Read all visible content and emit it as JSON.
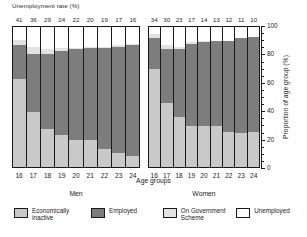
{
  "top_title": "Unemployment rate (%)",
  "axis": {
    "x_title": "Age groups",
    "y_title": "Proportion of age group (%)",
    "y_ticks": [
      "0",
      "20",
      "40",
      "60",
      "80",
      "100"
    ]
  },
  "panels": [
    {
      "name": "Men",
      "key": "men"
    },
    {
      "name": "Women",
      "key": "women"
    }
  ],
  "legend": [
    {
      "label": "Economically inactive",
      "color": "#c9c9c9",
      "key": "inactive"
    },
    {
      "label": "Employed",
      "color": "#7d7d7d",
      "key": "employed"
    },
    {
      "label": "On Government Scheme",
      "color": "#e2e2e2",
      "key": "scheme"
    },
    {
      "label": "Unemployed",
      "color": "#ffffff",
      "key": "unemployed"
    }
  ],
  "chart_data": {
    "type": "bar",
    "title": "Unemployment rate (%)",
    "xlabel": "Age groups",
    "ylabel": "Proportion of age group (%)",
    "ylim": [
      0,
      100
    ],
    "stacked": true,
    "grid": false,
    "legend_position": "bottom",
    "categories": [
      "16",
      "17",
      "18",
      "19",
      "20",
      "21",
      "22",
      "23",
      "24"
    ],
    "panels": [
      {
        "name": "Men",
        "unemployment_rate": [
          41,
          36,
          29,
          24,
          22,
          20,
          19,
          17,
          16
        ],
        "series": [
          {
            "name": "Economically inactive",
            "values": [
              63,
              39,
              27,
              23,
              19,
              19,
              13,
              10,
              8
            ]
          },
          {
            "name": "Employed",
            "values": [
              24,
              42,
              54,
              60,
              65,
              66,
              72,
              76,
              79
            ]
          },
          {
            "name": "On Government Scheme",
            "values": [
              4,
              5,
              3,
              2,
              1,
              1,
              1,
              1,
              1
            ]
          },
          {
            "name": "Unemployed",
            "values": [
              9,
              14,
              16,
              15,
              15,
              14,
              14,
              13,
              12
            ]
          }
        ]
      },
      {
        "name": "Women",
        "unemployment_rate": [
          34,
          30,
          23,
          17,
          14,
          13,
          12,
          11,
          10
        ],
        "series": [
          {
            "name": "Economically inactive",
            "values": [
              70,
              46,
              36,
              29,
              29,
              29,
              25,
              24,
              25
            ]
          },
          {
            "name": "Employed",
            "values": [
              22,
              38,
              48,
              59,
              60,
              61,
              65,
              68,
              68
            ]
          },
          {
            "name": "On Government Scheme",
            "values": [
              3,
              3,
              2,
              1,
              1,
              0,
              0,
              0,
              0
            ]
          },
          {
            "name": "Unemployed",
            "values": [
              5,
              13,
              14,
              11,
              10,
              10,
              10,
              8,
              7
            ]
          }
        ]
      }
    ]
  }
}
